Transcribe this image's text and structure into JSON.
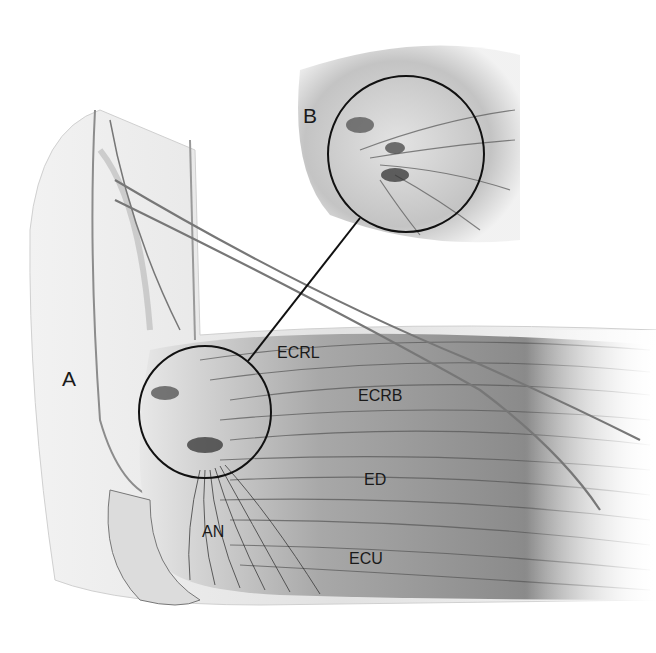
{
  "figure": {
    "labels": {
      "A": "A",
      "B": "B",
      "ecrl": "ECRL",
      "ecrb": "ECRB",
      "ed": "ED",
      "an": "AN",
      "ecu": "ECU"
    },
    "colors": {
      "background": "#ffffff",
      "outline": "#111111",
      "muscle_dark": "#6a6a6a",
      "muscle_light": "#d8d8d8"
    }
  }
}
